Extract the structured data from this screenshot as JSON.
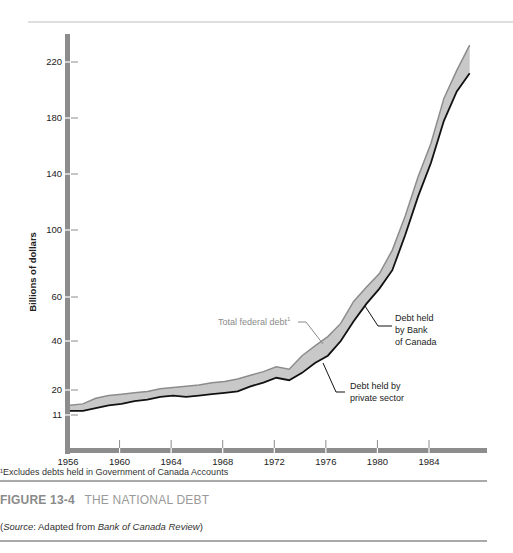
{
  "figure": {
    "number": "FIGURE 13-4",
    "title": "THE NATIONAL DEBT",
    "source_prefix": "(",
    "source_label": "Source",
    "source_middle": ": Adapted from ",
    "source_publication": "Bank of Canada Review",
    "source_suffix": ")",
    "footnote": "¹Excludes debts held in Government of Canada Accounts"
  },
  "colors": {
    "axis": "#8c8c8c",
    "band_fill": "#c8c8c8",
    "total_line": "#8c8c8c",
    "private_line": "#111111",
    "rule": "#9a9a9a",
    "annotation_gray": "#8a8a8a"
  },
  "chart_data": {
    "type": "area",
    "title": "THE NATIONAL DEBT",
    "xlabel": "",
    "ylabel": "Billions of dollars",
    "x_ticks": [
      1956,
      1960,
      1964,
      1968,
      1972,
      1976,
      1980,
      1984
    ],
    "y_ticks": [
      11,
      20,
      40,
      60,
      100,
      140,
      180,
      220
    ],
    "y_scale_note": "non-linear (expanded below 60)",
    "xlim": [
      1956,
      1988
    ],
    "grid": false,
    "x": [
      1956,
      1957,
      1958,
      1959,
      1960,
      1961,
      1962,
      1963,
      1964,
      1965,
      1966,
      1967,
      1968,
      1969,
      1970,
      1971,
      1972,
      1973,
      1974,
      1975,
      1976,
      1977,
      1978,
      1979,
      1980,
      1981,
      1982,
      1983,
      1984,
      1985,
      1986,
      1987
    ],
    "series": [
      {
        "name": "Total federal debt¹",
        "values": [
          14.5,
          15,
          17,
          18,
          18.5,
          19,
          19.5,
          20.5,
          21,
          21.5,
          22,
          23,
          23.5,
          24.5,
          26,
          27.5,
          29.5,
          28.5,
          34,
          38,
          42,
          48,
          58,
          66,
          74,
          88,
          110,
          138,
          162,
          194,
          214,
          232
        ]
      },
      {
        "name": "Debt held by private sector",
        "values": [
          12.5,
          12.5,
          13.5,
          14.5,
          15,
          16,
          16.5,
          17.5,
          18,
          17.5,
          18,
          18.5,
          19,
          19.5,
          21.5,
          23,
          25,
          24,
          27,
          31,
          34,
          40,
          49,
          57,
          65,
          76,
          97,
          124,
          148,
          178,
          199,
          212
        ]
      }
    ],
    "annotations": [
      {
        "text": "Total federal debt¹",
        "points_to": "upper edge (total)"
      },
      {
        "text": "Debt held by Bank of Canada",
        "points_to": "shaded band"
      },
      {
        "text": "Debt held by private sector",
        "points_to": "lower edge (private)"
      }
    ]
  },
  "labels": {
    "ylabel": "Billions of dollars",
    "total": "Total federal debt",
    "total_sup": "1",
    "boc_line1": "Debt held",
    "boc_line2": "by Bank",
    "boc_line3": "of Canada",
    "private_line1": "Debt held by",
    "private_line2": "private sector"
  }
}
